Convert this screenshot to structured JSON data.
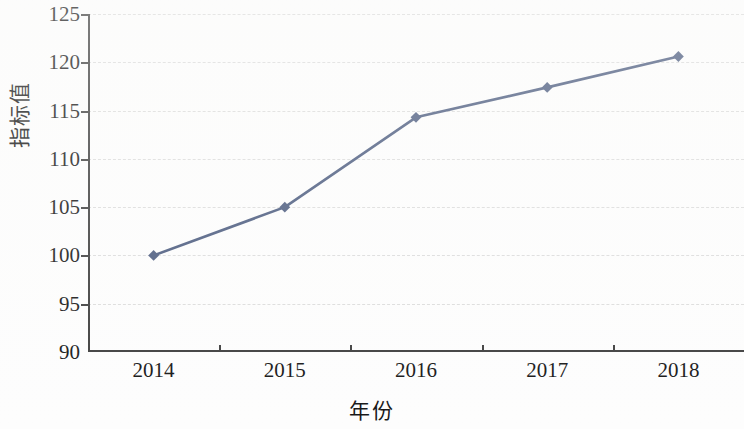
{
  "chart_data": {
    "type": "line",
    "title": "",
    "subtitle": "",
    "xlabel": "年份",
    "ylabel": "指标值",
    "categories": [
      "2014",
      "2015",
      "2016",
      "2017",
      "2018"
    ],
    "x": [
      2014,
      2015,
      2016,
      2017,
      2018
    ],
    "values": [
      100,
      105,
      114.3,
      117.4,
      120.6
    ],
    "series": [
      {
        "name": "指标值",
        "values": [
          100,
          105,
          114.3,
          117.4,
          120.6
        ]
      }
    ],
    "ylim": [
      90,
      125
    ],
    "yticks": [
      90,
      95,
      100,
      105,
      110,
      115,
      120,
      125
    ],
    "ytick_labels": [
      "90",
      "95",
      "100",
      "105",
      "110",
      "115",
      "120",
      "125"
    ],
    "xtick_labels": [
      "2014",
      "2015",
      "2016",
      "2017",
      "2018"
    ],
    "grid": "horizontal-dashed",
    "legend": "none",
    "marker": "diamond",
    "line_color": "#4a5a7e",
    "marker_color": "#4a5a7e",
    "grid_color": "#dcdcdc",
    "axis_color": "#3d3d3d",
    "background_color": "#fdfdfd",
    "annotations": []
  }
}
